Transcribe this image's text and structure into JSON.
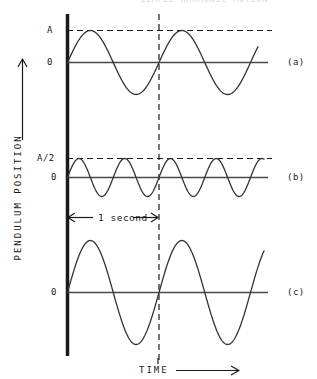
{
  "figure": {
    "caption_partial": "SIMPLE HARMONIC MOTION",
    "y_axis_label": "PENDULUM POSITION",
    "x_axis_label": "TIME",
    "y_axis_arrow": "up-arrow-icon",
    "x_axis_arrow": "right-arrow-icon",
    "time_annotation": "1 second",
    "time_annotation_left_arrow": "left-arrow-icon",
    "time_annotation_right_arrow": "right-arrow-icon",
    "panels": [
      {
        "id": "a",
        "label": "(a)",
        "amplitude_label": "A",
        "zero_label": "0",
        "has_amplitude_dashed_line": true
      },
      {
        "id": "b",
        "label": "(b)",
        "amplitude_label": "A/2",
        "zero_label": "0",
        "has_amplitude_dashed_line": true
      },
      {
        "id": "c",
        "label": "(c)",
        "amplitude_label": "",
        "zero_label": "0",
        "has_amplitude_dashed_line": false
      }
    ]
  },
  "colors": {
    "ink": "#1a1a1a",
    "curve": "#333333",
    "axis": "#4a4a4a",
    "dashed": "#1a1a1a",
    "background": "#ffffff"
  },
  "chart_data": {
    "type": "line",
    "title": "SIMPLE HARMONIC MOTION",
    "xlabel": "TIME",
    "ylabel": "PENDULUM POSITION",
    "grid": false,
    "legend": "right",
    "annotations": [
      {
        "text": "1 second",
        "x_start": 0.0,
        "x_end": 1.0,
        "panel": "b"
      },
      {
        "text": "vertical reference line at t = 1 second",
        "x": 1.0
      }
    ],
    "x": {
      "label": "TIME",
      "unit": "second",
      "range": [
        0,
        2.15
      ],
      "reference_line": 1.0,
      "ticks": []
    },
    "series": [
      {
        "name": "(a)",
        "panel": "a",
        "waveform": "sine",
        "amplitude": 1.0,
        "amplitude_label": "A",
        "period": 1.0,
        "cycles_shown": 2.0,
        "phase": 0,
        "baseline_label": "0",
        "ylim": [
          -1.25,
          1.25
        ],
        "yticks": [
          0,
          1.0
        ],
        "ytick_labels": [
          "0",
          "A"
        ]
      },
      {
        "name": "(b)",
        "panel": "b",
        "waveform": "sine",
        "amplitude": 0.5,
        "amplitude_label": "A/2",
        "period": 0.5,
        "cycles_shown": 4.0,
        "phase": 0,
        "baseline_label": "0",
        "ylim": [
          -0.65,
          0.65
        ],
        "yticks": [
          0,
          0.5
        ],
        "ytick_labels": [
          "0",
          "A/2"
        ]
      },
      {
        "name": "(c)",
        "panel": "c",
        "waveform": "sine",
        "amplitude": 1.45,
        "amplitude_label": "",
        "period": 1.0,
        "cycles_shown": 2.0,
        "phase": 0,
        "baseline_label": "0",
        "ylim": [
          -1.6,
          1.6
        ],
        "yticks": [
          0
        ],
        "ytick_labels": [
          "0"
        ]
      }
    ]
  }
}
